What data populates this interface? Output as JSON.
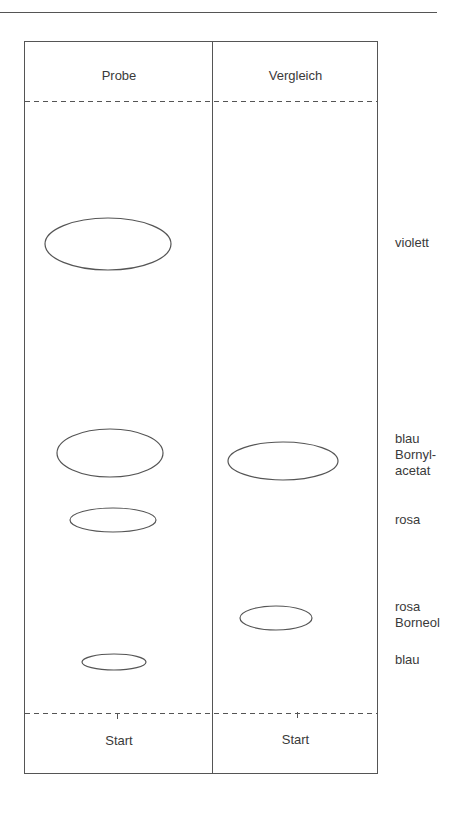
{
  "diagram": {
    "type": "thin-layer-chromatogram",
    "columns": [
      {
        "id": "probe",
        "header": "Probe",
        "footer": "Start"
      },
      {
        "id": "vergleich",
        "header": "Vergleich",
        "footer": "Start"
      }
    ],
    "spots": [
      {
        "lane": "probe",
        "color_label": "violett",
        "cx": 108,
        "cy": 244,
        "rx": 63,
        "ry": 26
      },
      {
        "lane": "probe",
        "color_label": "blau",
        "cx": 110,
        "cy": 453,
        "rx": 53,
        "ry": 24
      },
      {
        "lane": "probe",
        "color_label": "rosa",
        "cx": 113,
        "cy": 520,
        "rx": 43,
        "ry": 12
      },
      {
        "lane": "probe",
        "color_label": "blau",
        "cx": 114,
        "cy": 662,
        "rx": 32,
        "ry": 8
      },
      {
        "lane": "vergleich",
        "color_label": "blau",
        "substance": "Bornylacetat",
        "cx": 283,
        "cy": 461,
        "rx": 55,
        "ry": 19
      },
      {
        "lane": "vergleich",
        "color_label": "rosa",
        "substance": "Borneol",
        "cx": 276,
        "cy": 618,
        "rx": 36,
        "ry": 12
      }
    ],
    "side_labels": [
      {
        "lines": [
          "violett"
        ],
        "y": 235
      },
      {
        "lines": [
          "blau",
          "Bornyl-",
          "acetat"
        ],
        "y": 431
      },
      {
        "lines": [
          "rosa"
        ],
        "y": 512
      },
      {
        "lines": [
          "rosa",
          "Borneol"
        ],
        "y": 599
      },
      {
        "lines": [
          "blau"
        ],
        "y": 652
      }
    ]
  }
}
